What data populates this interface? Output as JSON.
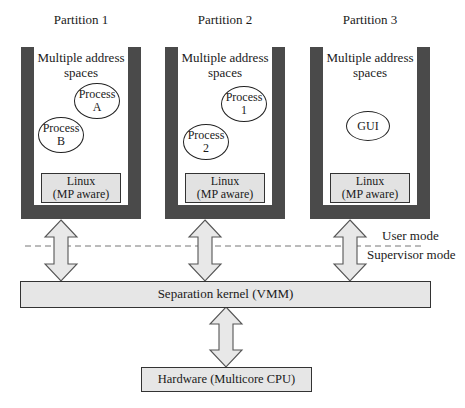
{
  "partitions": [
    {
      "title": "Partition 1",
      "address_label_line1": "Multiple address",
      "address_label_line2": "spaces",
      "processes": [
        {
          "line1": "Process",
          "line2": "A"
        },
        {
          "line1": "Process",
          "line2": "B"
        }
      ],
      "os_line1": "Linux",
      "os_line2": "(MP aware)"
    },
    {
      "title": "Partition 2",
      "address_label_line1": "Multiple address",
      "address_label_line2": "spaces",
      "processes": [
        {
          "line1": "Process",
          "line2": "1"
        },
        {
          "line1": "Process",
          "line2": "2"
        }
      ],
      "os_line1": "Linux",
      "os_line2": "(MP aware)"
    },
    {
      "title": "Partition 3",
      "address_label_line1": "Multiple address",
      "address_label_line2": "spaces",
      "processes": [
        {
          "line1": "GUI"
        }
      ],
      "os_line1": "Linux",
      "os_line2": "(MP aware)"
    }
  ],
  "modes": {
    "user": "User mode",
    "supervisor": "Supervisor mode"
  },
  "kernel": {
    "label": "Separation kernel (VMM)"
  },
  "hardware": {
    "label": "Hardware (Multicore CPU)"
  },
  "colors": {
    "wall": "#4a4a4a",
    "box_fill": "#e6e6e6",
    "arrow_fill": "#e8e8e8",
    "stroke": "#333333"
  }
}
